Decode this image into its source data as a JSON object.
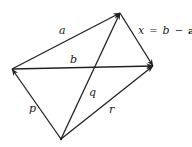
{
  "diagram": {
    "type": "vector-diagram",
    "points": {
      "L": {
        "x": 12,
        "y": 69
      },
      "T": {
        "x": 120,
        "y": 13
      },
      "R": {
        "x": 153,
        "y": 66
      },
      "B": {
        "x": 61,
        "y": 139
      }
    },
    "vectors": [
      {
        "name": "a",
        "from": "L",
        "to": "T",
        "label": "a"
      },
      {
        "name": "b",
        "from": "L",
        "to": "R",
        "label": "b"
      },
      {
        "name": "x",
        "from": "T",
        "to": "R",
        "label": "x = b − a"
      },
      {
        "name": "p",
        "from": "B",
        "to": "L",
        "label": "p"
      },
      {
        "name": "q",
        "from": "B",
        "to": "T",
        "label": "q"
      },
      {
        "name": "r",
        "from": "B",
        "to": "R",
        "label": "r"
      }
    ],
    "labels": {
      "a": "a",
      "b": "b",
      "x_var": "x",
      "x_eq": "=",
      "x_b": "b",
      "x_minus": "−",
      "x_a": "a",
      "p": "p",
      "q": "q",
      "r": "r"
    },
    "colors": {
      "stroke": "#222222",
      "background": "#ffffff"
    }
  }
}
